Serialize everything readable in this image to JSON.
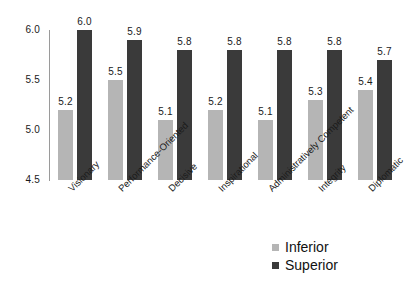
{
  "chart_data": {
    "type": "bar",
    "title": "",
    "subtitle": "",
    "xlabel": "",
    "ylabel": "",
    "ylim": [
      4.5,
      6.0
    ],
    "yticks": [
      "4.5",
      "5.0",
      "5.5",
      "6.0"
    ],
    "grid": false,
    "legend_position": "bottom-right",
    "categories": [
      "Visionary",
      "Performance-Oriented",
      "Decisive",
      "Inspirational",
      "Administratively Competent",
      "Integrity",
      "Diplomatic"
    ],
    "series": [
      {
        "name": "Inferior",
        "color": "#b5b5b5",
        "values": [
          5.2,
          5.5,
          5.1,
          5.2,
          5.1,
          5.3,
          5.4
        ],
        "labels": [
          "5.2",
          "5.5",
          "5.1",
          "5.2",
          "5.1",
          "5.3",
          "5.4"
        ]
      },
      {
        "name": "Superior",
        "color": "#3a3a3a",
        "values": [
          6.0,
          5.9,
          5.8,
          5.8,
          5.8,
          5.8,
          5.7
        ],
        "labels": [
          "6.0",
          "5.9",
          "5.8",
          "5.8",
          "5.8",
          "5.8",
          "5.7"
        ]
      }
    ]
  },
  "legend": {
    "items": [
      {
        "label": "Inferior",
        "color": "#b5b5b5"
      },
      {
        "label": "Superior",
        "color": "#3a3a3a"
      }
    ]
  }
}
